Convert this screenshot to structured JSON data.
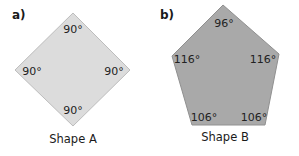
{
  "figure_a": {
    "part_label": "a)",
    "caption": "Shape A",
    "fill": "#dcdcdc",
    "stroke": "#b8b8b8",
    "angles": {
      "top": "90°",
      "left": "90°",
      "right": "90°",
      "bottom": "90°"
    }
  },
  "figure_b": {
    "part_label": "b)",
    "caption": "Shape B",
    "fill": "#a9a9a9",
    "stroke": "#8c8c8c",
    "angles": {
      "top": "96°",
      "left": "116°",
      "right": "116°",
      "bottom_left": "106°",
      "bottom_right": "106°"
    }
  }
}
